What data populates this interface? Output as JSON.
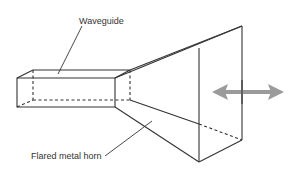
{
  "diagram": {
    "type": "horn antenna illustration",
    "labels": {
      "waveguide": "Waveguide",
      "horn": "Flared metal horn"
    },
    "arrow": {
      "meaning": "bidirectional wave propagation / radiation",
      "color": "#9a9a9a"
    },
    "colors": {
      "line": "#333333",
      "text": "#333333",
      "background": "#ffffff"
    }
  }
}
